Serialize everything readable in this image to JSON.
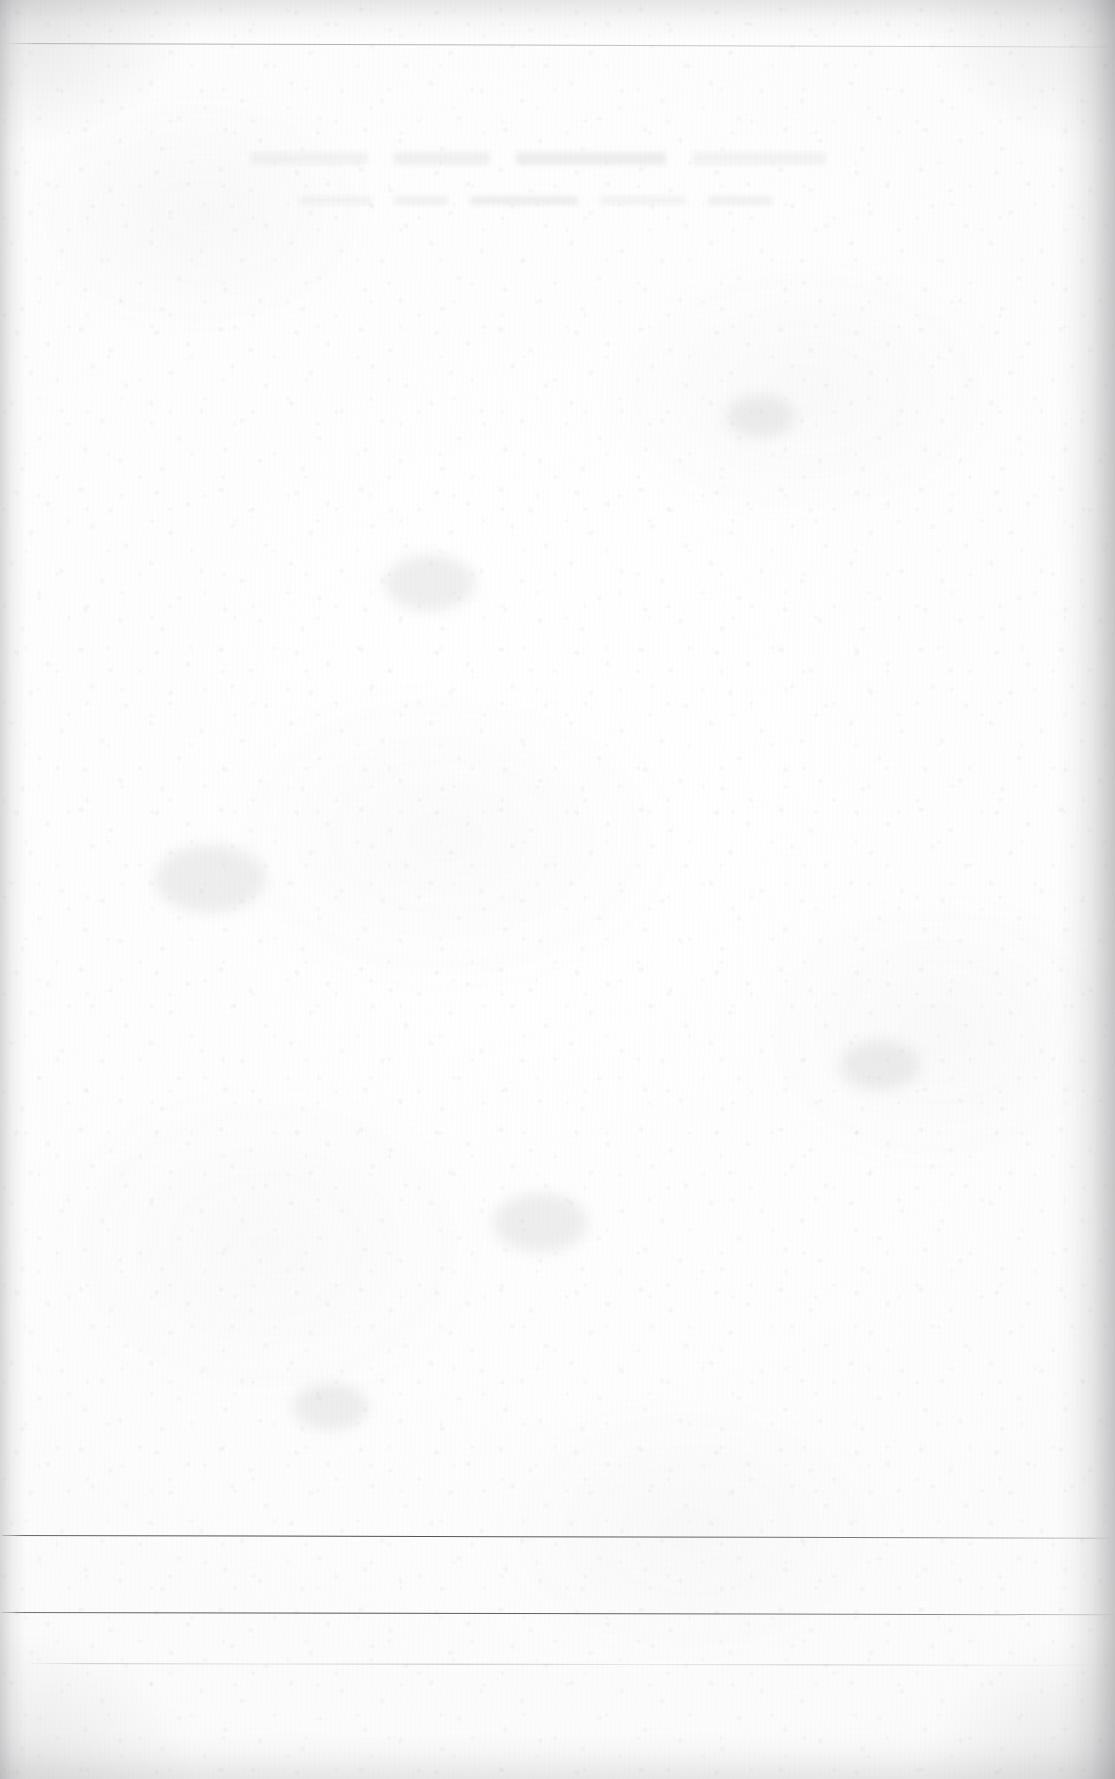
{
  "document": {
    "kind": "scanned-blank-page",
    "description": "Blank scanned leaf of a printed book or ledger; near-white mottled paper with fine fibre grain, a faint ruled line near the top, three ruled lines near the bottom, and an illegible show-through imprint from the reverse side.",
    "page_width_px": 1115,
    "page_height_px": 1779,
    "visible_text": "",
    "legible_text_present": false
  },
  "colors": {
    "paper_white": "#fdfdfd",
    "paper_base": "#fafafa",
    "paper_shade": "#f6f6f6",
    "grain_fibre": "#a8a8aa",
    "rule_dark": "#4a4a50",
    "rule_faint": "#8b8b91",
    "ghost_ink": "#929298",
    "edge_shadow": "#8d8d91"
  },
  "rules": [
    {
      "id": "top-rule",
      "label": "top horizontal rule",
      "y_px": 43,
      "x_start_px": 4,
      "x_end_px": 1109,
      "weight": "hairline",
      "tone": "very-faint",
      "skew_deg": 0.18
    },
    {
      "id": "bottom-rule-1",
      "label": "first bottom horizontal rule",
      "y_px": 1535,
      "x_start_px": 2,
      "x_end_px": 1110,
      "weight": "hairline",
      "tone": "dark",
      "skew_deg": 0.14
    },
    {
      "id": "bottom-rule-2",
      "label": "second bottom horizontal rule",
      "y_px": 1612,
      "x_start_px": 2,
      "x_end_px": 1110,
      "weight": "hairline",
      "tone": "dark",
      "skew_deg": 0.12
    },
    {
      "id": "bottom-rule-3",
      "label": "third bottom horizontal rule",
      "y_px": 1663,
      "x_start_px": 30,
      "x_end_px": 1090,
      "weight": "hairline",
      "tone": "faint-broken",
      "skew_deg": 0.1
    }
  ],
  "ghost_text": {
    "label": "verso show-through imprint",
    "legible": false,
    "region": {
      "x_px": 250,
      "y_px": 150,
      "width_px": 650,
      "height_px": 60
    },
    "heading_segment_widths_px": [
      118,
      96,
      150,
      134
    ],
    "subline_segment_widths_px": [
      72,
      54,
      108,
      86,
      64
    ]
  },
  "edges": {
    "left_shadow_width_px": 26,
    "right_shadow_width_px": 58,
    "top_shadow_height_px": 40,
    "bottom_shadow_height_px": 46
  },
  "smudges": [
    {
      "x_px": 430,
      "y_px": 600,
      "size_px": 90
    },
    {
      "x_px": 760,
      "y_px": 430,
      "size_px": 70
    },
    {
      "x_px": 210,
      "y_px": 900,
      "size_px": 110
    },
    {
      "x_px": 880,
      "y_px": 1080,
      "size_px": 80
    },
    {
      "x_px": 540,
      "y_px": 1240,
      "size_px": 95
    },
    {
      "x_px": 330,
      "y_px": 1420,
      "size_px": 75
    }
  ]
}
